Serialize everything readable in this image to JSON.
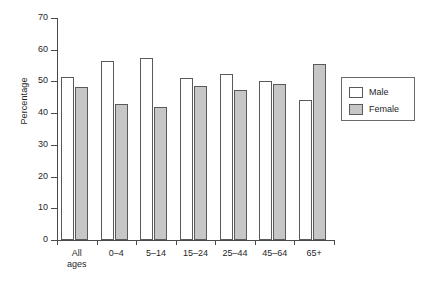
{
  "chart_data": {
    "type": "bar",
    "title": "",
    "xlabel": "",
    "ylabel": "Percentage",
    "ylim": [
      0,
      70
    ],
    "yticks": [
      0,
      10,
      20,
      30,
      40,
      50,
      60,
      70
    ],
    "ytick_labels": [
      "0",
      "10",
      "20",
      "30",
      "40",
      "50",
      "60",
      "70"
    ],
    "grid": false,
    "legend_position": "right",
    "categories": [
      "All\nages",
      "0–4",
      "5–14",
      "15–24",
      "25–44",
      "45–64",
      "65+"
    ],
    "series": [
      {
        "name": "Male",
        "color": "#ffffff",
        "edge_color": "#5a5a5a",
        "values": [
          51.5,
          56.3,
          57.5,
          51.2,
          52.2,
          50.2,
          44.3
        ]
      },
      {
        "name": "Female",
        "color": "#c6c6c6",
        "edge_color": "#5a5a5a",
        "values": [
          48.2,
          43.0,
          42.0,
          48.5,
          47.3,
          49.2,
          55.4
        ]
      }
    ]
  },
  "legend": {
    "items": [
      {
        "label": "Male",
        "swatch": "male"
      },
      {
        "label": "Female",
        "swatch": "female"
      }
    ]
  }
}
